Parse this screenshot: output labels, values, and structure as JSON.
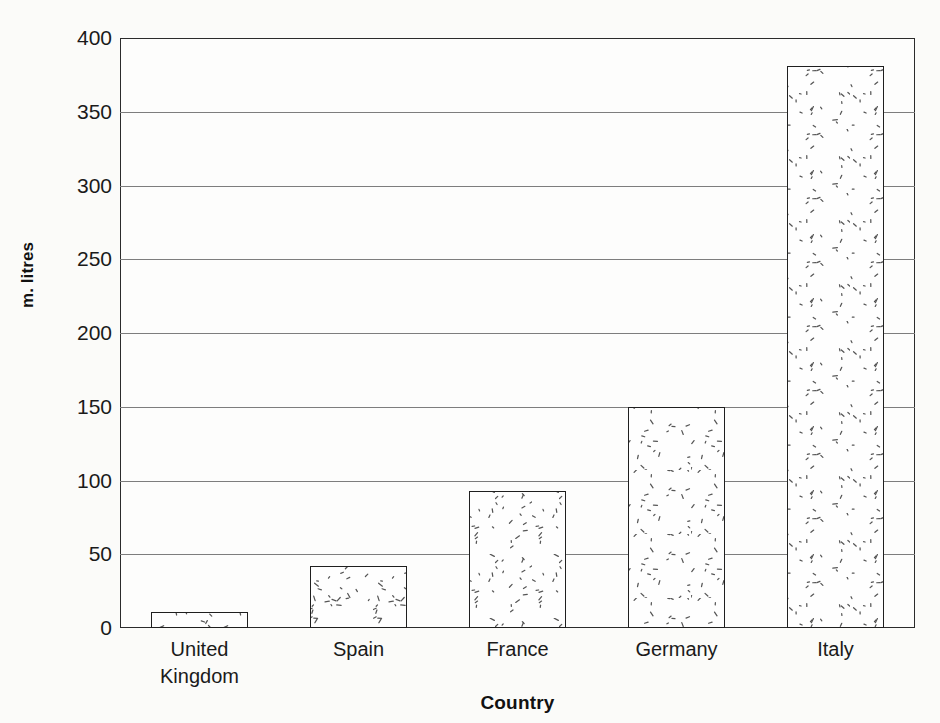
{
  "chart_data": {
    "type": "bar",
    "title": "",
    "subtitle": "",
    "xlabel": "Country",
    "ylabel": "m. litres",
    "categories": [
      "United Kingdom",
      "Spain",
      "France",
      "Germany",
      "Italy"
    ],
    "category_lines": [
      [
        "United",
        "Kingdom"
      ],
      [
        "Spain"
      ],
      [
        "France"
      ],
      [
        "Germany"
      ],
      [
        "Italy"
      ]
    ],
    "values": [
      11,
      42,
      93,
      150,
      381
    ],
    "ylim": [
      0,
      400
    ],
    "ytick_values": [
      0,
      50,
      100,
      150,
      200,
      250,
      300,
      350,
      400
    ],
    "ytick_labels": [
      "0",
      "50",
      "100",
      "150",
      "200",
      "250",
      "300",
      "350",
      "400"
    ],
    "grid": true,
    "legend": false,
    "legend_position": "none",
    "bar_fill_pattern": "scattered-dashes",
    "bar_edge_color": "#1f1f1f",
    "bar_face_color": "#fefefe",
    "gridline_color": "#7d7d7d",
    "axis_color": "#2b2b2b",
    "background_color": "#fbfbf9"
  }
}
